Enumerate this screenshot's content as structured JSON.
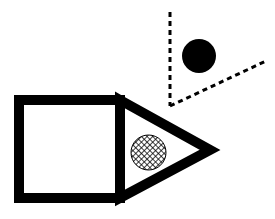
{
  "image": {
    "title": "Black and white geometric line drawing",
    "width": 275,
    "height": 219,
    "background_color": "#ffffff",
    "ink_color": "#000000"
  },
  "figure": {
    "stroke_color": "#000000",
    "fill_color": "#ffffff",
    "stroke_width": 10
  },
  "shapes": {
    "square": {
      "name": "square-body",
      "label": "Square",
      "x": 19,
      "y": 100,
      "width": 101,
      "height": 98,
      "stroke_width": 10,
      "fill": "#ffffff",
      "stroke": "#000000"
    },
    "triangle": {
      "name": "triangle-tip",
      "label": "Triangle",
      "points": "120,100 210,150 120,198",
      "stroke_width": 10,
      "fill": "#ffffff",
      "stroke": "#000000",
      "apex_x": 210,
      "apex_y": 150
    },
    "hatched_circle": {
      "name": "hatched-circle",
      "label": "Crosshatched circle",
      "cx": 148.5,
      "cy": 152.5,
      "r": 17.5,
      "fill_pattern": "crosshatch",
      "stroke": "#000000",
      "stroke_width": 1
    },
    "solid_circle": {
      "name": "solid-circle",
      "label": "Solid black circle",
      "cx": 199,
      "cy": 56,
      "r": 17,
      "fill": "#000000"
    }
  },
  "dashed_angle": {
    "name": "dashed-angle",
    "label": "Dashed angle",
    "vertex_x": 170,
    "vertex_y": 106,
    "stroke": "#000000",
    "stroke_width": 3,
    "dash_pattern": "5 4",
    "rays": [
      {
        "name": "vertical-dashed-ray",
        "label": "Vertical dashed ray",
        "x1": 170,
        "y1": 12,
        "x2": 170,
        "y2": 106
      },
      {
        "name": "diagonal-dashed-ray",
        "label": "Diagonal dashed ray",
        "x1": 170,
        "y1": 106,
        "x2": 266,
        "y2": 61
      }
    ]
  }
}
